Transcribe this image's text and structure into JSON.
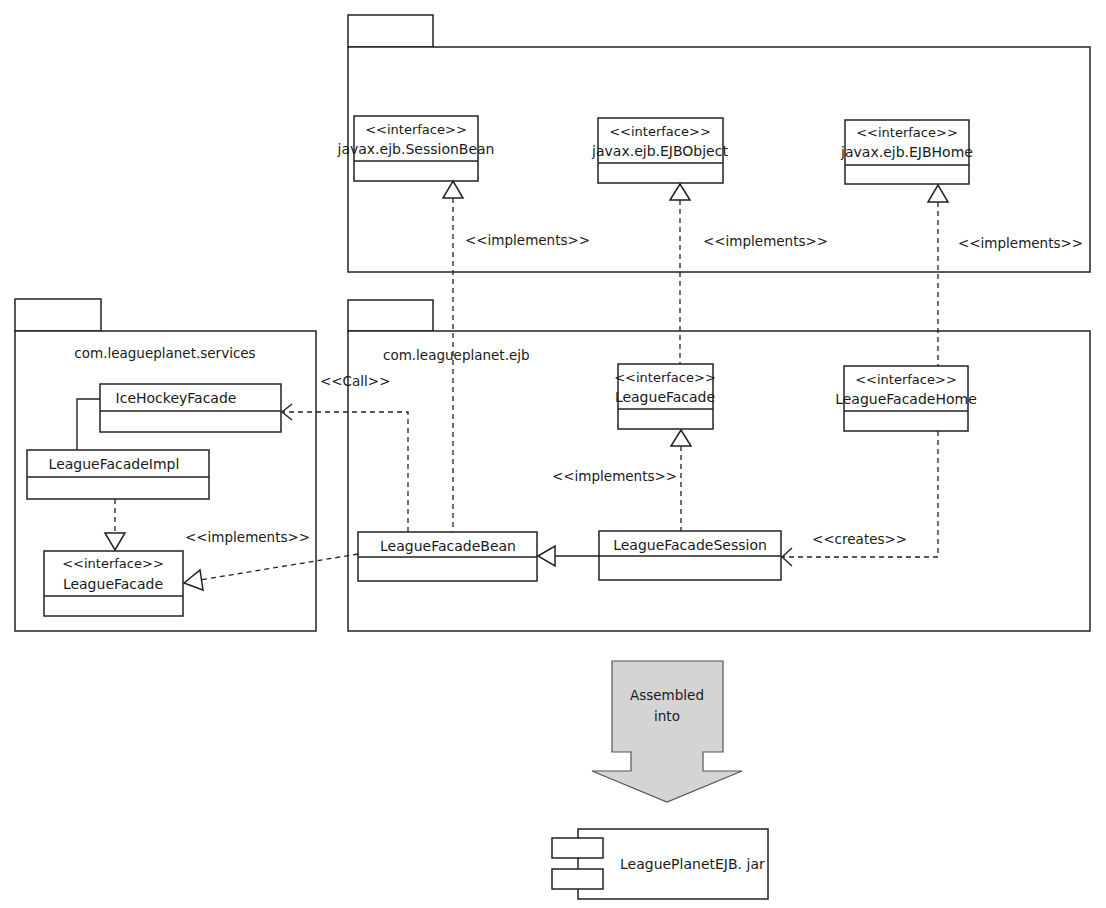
{
  "diagram": {
    "type": "uml-package-class-diagram",
    "packages": [
      {
        "id": "ejb-api",
        "name": ""
      },
      {
        "id": "services",
        "name": "com.leagueplanet.services"
      },
      {
        "id": "ejb",
        "name": "com.leagueplanet.ejb"
      }
    ],
    "classes": {
      "session_bean": {
        "stereotype": "<<interface>>",
        "name": "javax.ejb.SessionBean"
      },
      "ejb_object": {
        "stereotype": "<<interface>>",
        "name": "javax.ejb.EJBObject"
      },
      "ejb_home": {
        "stereotype": "<<interface>>",
        "name": "javax.ejb.EJBHome"
      },
      "ice_hockey_facade": {
        "name": "IceHockeyFacade"
      },
      "league_facade_impl": {
        "name": "LeagueFacadeImpl"
      },
      "services_league_facade": {
        "stereotype": "<<interface>>",
        "name": "LeagueFacade"
      },
      "ejb_league_facade": {
        "stereotype": "<<interface>>",
        "name": "LeagueFacade"
      },
      "league_facade_home": {
        "stereotype": "<<interface>>",
        "name": "LeagueFacadeHome"
      },
      "league_facade_bean": {
        "name": "LeagueFacadeBean"
      },
      "league_facade_session": {
        "name": "LeagueFacadeSession"
      }
    },
    "relations": {
      "bean_implements_sessionbean": "<<implements>>",
      "session_implements_ejbobject": "<<implements>>",
      "home_implements_ejbhome": "<<implements>>",
      "bean_calls_icehockey": "<<Call>>",
      "bean_implements_services_facade": "<<implements>>",
      "session_implements_ejb_facade": "<<implements>>",
      "home_creates_session": "<<creates>>"
    },
    "assembly": {
      "arrow_label_line1": "Assembled",
      "arrow_label_line2": "into",
      "arrow_fill": "#d4d4d4",
      "component_name": "LeaguePlanetEJB. jar"
    }
  }
}
